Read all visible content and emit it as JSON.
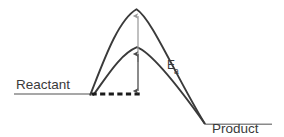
{
  "diagram": {
    "type": "reaction-energy-profile",
    "title": "",
    "background_color": "#ffffff",
    "labels": {
      "reactant": "Reactant",
      "product": "Product",
      "activation_energy_symbol": "E",
      "activation_energy_subscript": "a"
    },
    "colors": {
      "curve_stroke": "#3a3a3a",
      "baseline_stroke": "#7d7d7d",
      "dashed_line_stroke": "#1a1a1a",
      "arrow_upper_stroke": "#9a9a9a",
      "arrow_lower_stroke": "#5a5a5a",
      "text_fill": "#3a3a3a"
    },
    "elements": {
      "reactant_baseline": {
        "name": "reactant-baseline",
        "x_start": 14,
        "x_end": 91,
        "y": 94
      },
      "product_baseline": {
        "name": "product-baseline",
        "x_start": 205,
        "x_end": 272,
        "y": 124
      },
      "dashed_reference_line": {
        "name": "dashed-reference-line",
        "x_start": 91,
        "x_end": 142,
        "y": 94,
        "dash_pattern": "5,3"
      },
      "outer_curve": {
        "name": "uncatalyzed-energy-curve",
        "peak_x": 136,
        "peak_y": 9,
        "start_x": 90,
        "start_y": 95,
        "end_x": 205,
        "end_y": 124
      },
      "inner_curve": {
        "name": "catalyzed-energy-curve",
        "peak_x": 137,
        "peak_y": 47,
        "start_x": 93,
        "start_y": 95,
        "end_x": 205,
        "end_y": 124
      },
      "upper_arrow": {
        "name": "total-energy-arrow",
        "x": 138,
        "y_top": 12,
        "y_bottom": 62,
        "head": "up"
      },
      "lower_arrow": {
        "name": "activation-energy-arrow",
        "x": 138,
        "y_top": 50,
        "y_bottom": 93,
        "head": "both"
      }
    },
    "label_positions": {
      "reactant": {
        "x": 16,
        "y": 88
      },
      "product": {
        "x": 212,
        "y": 133
      },
      "ea": {
        "x": 168,
        "y": 70
      }
    }
  }
}
